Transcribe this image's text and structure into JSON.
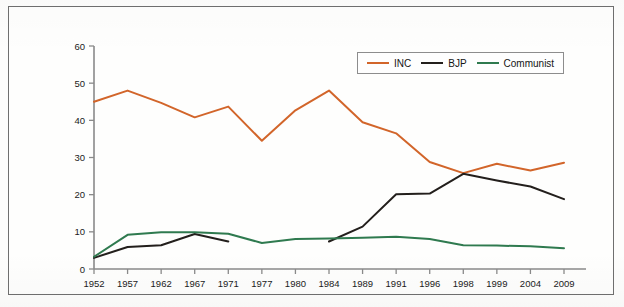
{
  "figure": {
    "frame_color": "#6f6f6f",
    "background": "#fefefd"
  },
  "legend": {
    "position": "top-right-inside",
    "entries": [
      {
        "label": "INC",
        "color": "#d2652a"
      },
      {
        "label": "BJP",
        "color": "#231f1c"
      },
      {
        "label": "Communist",
        "color": "#2f7a4f"
      }
    ]
  },
  "axes": {
    "y_ticks": [
      "0",
      "10",
      "20",
      "30",
      "40",
      "50",
      "60"
    ],
    "x_ticks": [
      "1952",
      "1957",
      "1962",
      "1967",
      "1971",
      "1977",
      "1980",
      "1984",
      "1989",
      "1991",
      "1996",
      "1998",
      "1999",
      "2004",
      "2009"
    ],
    "y_min": 0,
    "y_max": 60,
    "axis_color": "#8a8a8a"
  },
  "chart_data": {
    "type": "line",
    "xlabel": "",
    "ylabel": "",
    "ylim": [
      0,
      60
    ],
    "ytick_step": 10,
    "grid": false,
    "legend_position": "upper right",
    "categories": [
      "1952",
      "1957",
      "1962",
      "1967",
      "1971",
      "1977",
      "1980",
      "1984",
      "1989",
      "1991",
      "1996",
      "1998",
      "1999",
      "2004",
      "2009"
    ],
    "series": [
      {
        "name": "INC",
        "color": "#d2652a",
        "values": [
          45,
          48,
          44.7,
          40.8,
          43.7,
          34.5,
          42.7,
          48,
          39.5,
          36.5,
          28.8,
          25.8,
          28.3,
          26.5,
          28.6
        ]
      },
      {
        "name": "BJP",
        "color": "#231f1c",
        "values": [
          3,
          5.9,
          6.4,
          9.4,
          7.4,
          null,
          null,
          7.4,
          11.4,
          20.1,
          20.3,
          25.6,
          23.8,
          22.2,
          18.8
        ]
      },
      {
        "name": "Communist",
        "color": "#2f7a4f",
        "values": [
          3.3,
          9.2,
          9.9,
          9.9,
          9.5,
          7,
          8.1,
          8.2,
          8.4,
          8.7,
          8.1,
          6.4,
          6.3,
          6.1,
          5.6
        ]
      }
    ]
  }
}
